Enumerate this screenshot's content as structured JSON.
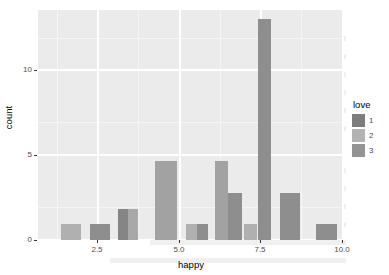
{
  "chart_data": {
    "type": "bar",
    "title": "",
    "subtitle": "",
    "xlabel": "happy",
    "ylabel": "count",
    "xlim": [
      1.3,
      10.7
    ],
    "ylim": [
      0,
      14.6
    ],
    "xticks": [
      "2.5",
      "5.0",
      "7.5",
      "10.0"
    ],
    "xtick_values": [
      2.5,
      5.0,
      7.5,
      10.0
    ],
    "yticks": [
      "0",
      "5",
      "10"
    ],
    "ytick_values": [
      0,
      5,
      10
    ],
    "grid": true,
    "legend": {
      "title": "love",
      "position": "right",
      "entries": [
        {
          "label": "1",
          "color": "#7d7d7d"
        },
        {
          "label": "2",
          "color": "#b3b3b3"
        },
        {
          "label": "3",
          "color": "#949494"
        }
      ]
    },
    "bars": [
      {
        "x": 2.0,
        "width": 0.62,
        "value": 1,
        "love": "2",
        "color": "#b0b0b0"
      },
      {
        "x": 2.9,
        "width": 0.62,
        "value": 1,
        "love": "1",
        "color": "#8e8e8e"
      },
      {
        "x": 3.75,
        "width": 0.3,
        "value": 2,
        "love": "1",
        "color": "#858585"
      },
      {
        "x": 4.05,
        "width": 0.32,
        "value": 2,
        "love": "2",
        "color": "#a8a8a8"
      },
      {
        "x": 4.9,
        "width": 0.68,
        "value": 5,
        "love": "3",
        "color": "#a2a2a2"
      },
      {
        "x": 5.85,
        "width": 0.33,
        "value": 1,
        "love": "2",
        "color": "#b0b0b0"
      },
      {
        "x": 6.18,
        "width": 0.33,
        "value": 1,
        "love": "1",
        "color": "#8e8e8e"
      },
      {
        "x": 6.75,
        "width": 0.4,
        "value": 5,
        "love": "3",
        "color": "#a2a2a2"
      },
      {
        "x": 7.15,
        "width": 0.42,
        "value": 3,
        "love": "1",
        "color": "#8e8e8e"
      },
      {
        "x": 7.62,
        "width": 0.42,
        "value": 1,
        "love": "2",
        "color": "#b0b0b0"
      },
      {
        "x": 8.05,
        "width": 0.42,
        "value": 14,
        "love": "1",
        "color": "#8e8e8e"
      },
      {
        "x": 8.72,
        "width": 0.62,
        "value": 3,
        "love": "1",
        "color": "#8e8e8e"
      },
      {
        "x": 9.85,
        "width": 0.62,
        "value": 1,
        "love": "1",
        "color": "#8e8e8e"
      }
    ],
    "panel_background": "#ebebeb",
    "grid_color": "#ffffff"
  }
}
